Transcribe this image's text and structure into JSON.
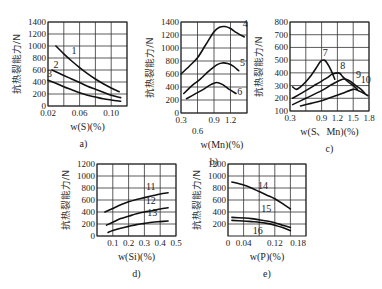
{
  "figure": {
    "ylabel_text": "抗热裂能力/N",
    "panels": [
      "a",
      "b",
      "c",
      "d",
      "e"
    ]
  },
  "chart_data": [
    {
      "id": "a",
      "type": "line",
      "subplot_label": "a)",
      "xlabel": "w(S)(%)",
      "ylabel": "抗热裂能力/N",
      "xlim": [
        0.02,
        0.12
      ],
      "ylim": [
        0,
        1400
      ],
      "xticks": [
        0.02,
        0.06,
        0.1
      ],
      "xtick_labels": [
        "0.02",
        "0.06",
        "0.10"
      ],
      "xgrid": [
        0.02,
        0.04,
        0.06,
        0.08,
        0.1,
        0.12
      ],
      "yticks": [
        0,
        200,
        400,
        600,
        800,
        1000,
        1200,
        1400
      ],
      "ytick_labels": [
        "0",
        "200",
        "400",
        "600",
        "800",
        "1000",
        "1200",
        "1400"
      ],
      "grid": true,
      "box": {
        "x0": 48,
        "x1": 127,
        "y0": 22,
        "y1": 106
      },
      "series": [
        {
          "name": "1",
          "x": [
            0.03,
            0.04,
            0.05,
            0.06,
            0.07,
            0.08,
            0.09,
            0.1,
            0.11
          ],
          "y": [
            1000,
            870,
            750,
            640,
            540,
            450,
            370,
            300,
            240
          ],
          "label_pos": [
            0.053,
            860
          ]
        },
        {
          "name": "2",
          "x": [
            0.025,
            0.04,
            0.05,
            0.06,
            0.07,
            0.08,
            0.09,
            0.1,
            0.112
          ],
          "y": [
            600,
            510,
            450,
            390,
            330,
            280,
            230,
            180,
            140
          ],
          "label_pos": [
            0.03,
            640
          ]
        },
        {
          "name": "3",
          "x": [
            0.02,
            0.03,
            0.04,
            0.05,
            0.06,
            0.07,
            0.08,
            0.09,
            0.1,
            0.112
          ],
          "y": [
            430,
            380,
            320,
            270,
            220,
            180,
            150,
            120,
            100,
            80
          ],
          "label_pos": [
            0.022,
            490
          ]
        }
      ]
    },
    {
      "id": "b",
      "type": "line",
      "subplot_label": "b)",
      "xlabel": "w(Mn)(%)",
      "ylabel": "抗热裂能力/N",
      "xlim": [
        0.3,
        1.5
      ],
      "ylim": [
        0,
        1400
      ],
      "xticks": [
        0.3,
        0.6,
        0.9,
        1.2
      ],
      "xtick_labels": [
        "0.3",
        "0.6",
        "0.9",
        "1.2"
      ],
      "xtick_offset": [
        0,
        1,
        0,
        0
      ],
      "xgrid": [
        0.3,
        0.6,
        0.9,
        1.2,
        1.5
      ],
      "yticks": [
        0,
        200,
        400,
        600,
        800,
        1000,
        1200,
        1400
      ],
      "ytick_labels": [
        "0",
        "200",
        "400",
        "600",
        "800",
        "1000",
        "1200",
        "1400"
      ],
      "grid": true,
      "box": {
        "x0": 181,
        "x1": 247,
        "y0": 22,
        "y1": 113
      },
      "series": [
        {
          "name": "4",
          "x": [
            0.3,
            0.45,
            0.6,
            0.75,
            0.9,
            1.0,
            1.1,
            1.2,
            1.3,
            1.45
          ],
          "y": [
            600,
            720,
            850,
            1050,
            1250,
            1320,
            1330,
            1300,
            1240,
            1170
          ],
          "label_pos": [
            1.47,
            1320
          ]
        },
        {
          "name": "5",
          "x": [
            0.35,
            0.5,
            0.65,
            0.8,
            0.95,
            1.05,
            1.15,
            1.25,
            1.35
          ],
          "y": [
            300,
            420,
            520,
            640,
            740,
            770,
            760,
            720,
            650
          ],
          "label_pos": [
            1.42,
            730
          ]
        },
        {
          "name": "6",
          "x": [
            0.4,
            0.55,
            0.7,
            0.85,
            0.95,
            1.05,
            1.15,
            1.3
          ],
          "y": [
            220,
            290,
            360,
            440,
            470,
            440,
            380,
            300
          ],
          "label_pos": [
            1.37,
            270
          ]
        }
      ]
    },
    {
      "id": "c",
      "type": "line",
      "subplot_label": "c)",
      "xlabel": "w(S、Mn)(%)",
      "ylabel": "抗热裂能力/N",
      "xlim": [
        0.3,
        1.8
      ],
      "ylim": [
        100,
        800
      ],
      "xticks": [
        0.3,
        0.9,
        1.2,
        1.5,
        1.8
      ],
      "xtick_labels": [
        "0.3",
        "0.9",
        "1.2",
        "1.5",
        "1.8"
      ],
      "xgrid": [
        0.3,
        0.6,
        0.9,
        1.2,
        1.5,
        1.8
      ],
      "yticks": [
        100,
        200,
        300,
        400,
        500,
        600,
        700,
        800
      ],
      "ytick_labels": [
        "100",
        "200",
        "300",
        "400",
        "500",
        "600",
        "700",
        "800"
      ],
      "grid": true,
      "box": {
        "x0": 290,
        "x1": 369,
        "y0": 22,
        "y1": 111
      },
      "series": [
        {
          "name": "7",
          "x": [
            0.35,
            0.42,
            0.5,
            0.6,
            0.7,
            0.8,
            0.88,
            0.95,
            1.0,
            1.08,
            1.15
          ],
          "y": [
            290,
            270,
            290,
            330,
            380,
            440,
            490,
            500,
            480,
            420,
            350
          ],
          "label_pos": [
            0.97,
            530
          ]
        },
        {
          "name": "8",
          "x": [
            0.35,
            0.6,
            0.8,
            1.0,
            1.1,
            1.2,
            1.25,
            1.3,
            1.4,
            1.5,
            1.58
          ],
          "y": [
            200,
            260,
            310,
            360,
            390,
            400,
            395,
            370,
            330,
            300,
            270
          ],
          "label_pos": [
            1.3,
            430
          ]
        },
        {
          "name": "9",
          "x": [
            0.35,
            0.6,
            0.9,
            1.1,
            1.3,
            1.42,
            1.55,
            1.65,
            1.72
          ],
          "y": [
            150,
            200,
            260,
            310,
            350,
            340,
            300,
            270,
            240
          ],
          "label_pos": [
            1.6,
            360
          ]
        },
        {
          "name": "10",
          "x": [
            0.5,
            0.7,
            0.9,
            1.1,
            1.3,
            1.5,
            1.6,
            1.7,
            1.78
          ],
          "y": [
            140,
            160,
            180,
            210,
            240,
            270,
            260,
            240,
            220
          ],
          "label_pos": [
            1.74,
            320
          ]
        }
      ]
    },
    {
      "id": "d",
      "type": "line",
      "subplot_label": "d)",
      "xlabel": "w(Si)(%)",
      "ylabel": "抗热裂能力/N",
      "xlim": [
        0.0,
        0.5
      ],
      "ylim": [
        0,
        1200
      ],
      "xticks": [
        0.1,
        0.2,
        0.3,
        0.4,
        0.5
      ],
      "xtick_labels": [
        "0.1",
        "0.2",
        "0.3",
        "0.4",
        "0.5"
      ],
      "xgrid": [
        0.0,
        0.1,
        0.2,
        0.3,
        0.4,
        0.5
      ],
      "yticks": [
        0,
        200,
        400,
        600,
        800,
        1000,
        1200
      ],
      "ytick_labels": [
        "0",
        "200",
        "400",
        "600",
        "800",
        "1000",
        "1200"
      ],
      "grid": true,
      "box": {
        "x0": 97,
        "x1": 176,
        "y0": 164,
        "y1": 236
      },
      "series": [
        {
          "name": "11",
          "x": [
            0.05,
            0.1,
            0.15,
            0.2,
            0.25,
            0.3,
            0.35,
            0.4,
            0.45
          ],
          "y": [
            400,
            460,
            520,
            570,
            610,
            640,
            670,
            700,
            720
          ],
          "label_pos": [
            0.34,
            760
          ]
        },
        {
          "name": "12",
          "x": [
            0.06,
            0.1,
            0.15,
            0.2,
            0.25,
            0.3,
            0.35,
            0.4,
            0.45
          ],
          "y": [
            180,
            230,
            290,
            330,
            370,
            400,
            420,
            450,
            470
          ],
          "label_pos": [
            0.34,
            540
          ]
        },
        {
          "name": "13",
          "x": [
            0.07,
            0.1,
            0.15,
            0.2,
            0.25,
            0.3,
            0.35,
            0.4,
            0.45
          ],
          "y": [
            60,
            90,
            130,
            160,
            190,
            210,
            230,
            240,
            250
          ],
          "label_pos": [
            0.35,
            340
          ]
        }
      ]
    },
    {
      "id": "e",
      "type": "line",
      "subplot_label": "e)",
      "xlabel": "w(P)(%)",
      "ylabel": "抗热裂能力/N",
      "xlim": [
        0.0,
        0.2
      ],
      "ylim": [
        0,
        1200
      ],
      "xticks": [
        0,
        0.04,
        0.12,
        0.18
      ],
      "xtick_labels": [
        "0",
        "0.04",
        "0.12",
        "0.18"
      ],
      "xgrid": [
        0.0,
        0.04,
        0.08,
        0.12,
        0.16,
        0.2
      ],
      "yticks": [
        200,
        400,
        600,
        800,
        1000,
        1200
      ],
      "ytick_labels": [
        "200",
        "400",
        "600",
        "800",
        "1000",
        "1200"
      ],
      "grid": true,
      "box": {
        "x0": 228,
        "x1": 306,
        "y0": 164,
        "y1": 236
      },
      "series": [
        {
          "name": "14",
          "x": [
            0.01,
            0.04,
            0.06,
            0.08,
            0.1,
            0.12,
            0.14,
            0.16
          ],
          "y": [
            900,
            850,
            800,
            740,
            680,
            620,
            540,
            450
          ],
          "label_pos": [
            0.09,
            790
          ]
        },
        {
          "name": "15",
          "x": [
            0.01,
            0.04,
            0.06,
            0.08,
            0.1,
            0.12,
            0.14,
            0.16
          ],
          "y": [
            310,
            300,
            290,
            270,
            250,
            220,
            180,
            140
          ],
          "label_pos": [
            0.098,
            400
          ]
        },
        {
          "name": "16",
          "x": [
            0.01,
            0.04,
            0.06,
            0.08,
            0.1,
            0.12,
            0.14,
            0.16
          ],
          "y": [
            260,
            250,
            240,
            230,
            210,
            180,
            140,
            90
          ],
          "label_pos": [
            0.076,
            40
          ]
        }
      ]
    }
  ]
}
